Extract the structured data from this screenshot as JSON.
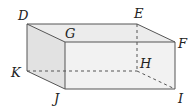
{
  "diagram": {
    "type": "rectangular-prism",
    "colors": {
      "stroke": "#555555",
      "front_face": "#f2f2f2",
      "top_face": "#ececec",
      "side_face": "#e2e2e2",
      "label": "#222222"
    },
    "vertices": {
      "D": {
        "x": 27,
        "y": 24
      },
      "E": {
        "x": 137,
        "y": 24
      },
      "G": {
        "x": 65,
        "y": 42
      },
      "F": {
        "x": 175,
        "y": 42
      },
      "K": {
        "x": 27,
        "y": 71
      },
      "H": {
        "x": 137,
        "y": 71
      },
      "J": {
        "x": 65,
        "y": 89
      },
      "I": {
        "x": 175,
        "y": 89
      }
    },
    "labels": [
      {
        "text": "D",
        "x": 18,
        "y": 20
      },
      {
        "text": "E",
        "x": 134,
        "y": 18
      },
      {
        "text": "G",
        "x": 65,
        "y": 38
      },
      {
        "text": "F",
        "x": 178,
        "y": 48
      },
      {
        "text": "K",
        "x": 11,
        "y": 77
      },
      {
        "text": "H",
        "x": 140,
        "y": 68
      },
      {
        "text": "J",
        "x": 54,
        "y": 103
      },
      {
        "text": "I",
        "x": 178,
        "y": 103
      }
    ],
    "hidden_edges": [
      "EH",
      "KH",
      "HI"
    ]
  }
}
